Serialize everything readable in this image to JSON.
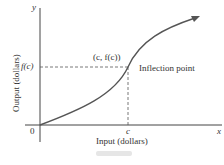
{
  "diagram": {
    "axes": {
      "x_symbol": "x",
      "y_symbol": "y",
      "origin": "0",
      "x_label": "Input (dollars)",
      "y_label": "Output (dollars)"
    },
    "point": {
      "x_tick": "c",
      "y_tick": "f(c)",
      "coord_label": "(c, f(c))",
      "annotation": "Inflection point"
    },
    "colors": {
      "curve": "#555555",
      "axis": "#444444"
    }
  }
}
